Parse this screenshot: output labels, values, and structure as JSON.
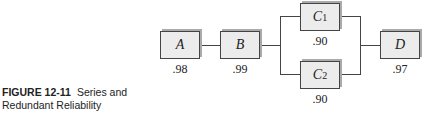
{
  "caption": {
    "figure_label": "FIGURE 12-11",
    "title_line1": "Series and",
    "title_line2": "Redundant Reliability"
  },
  "components": {
    "A": {
      "label": "A",
      "reliability": ".98"
    },
    "B": {
      "label": "B",
      "reliability": ".99"
    },
    "C1": {
      "label": "C",
      "sub": "1",
      "reliability": ".90"
    },
    "C2": {
      "label": "C",
      "sub": "2",
      "reliability": ".90"
    },
    "D": {
      "label": "D",
      "reliability": ".97"
    }
  }
}
